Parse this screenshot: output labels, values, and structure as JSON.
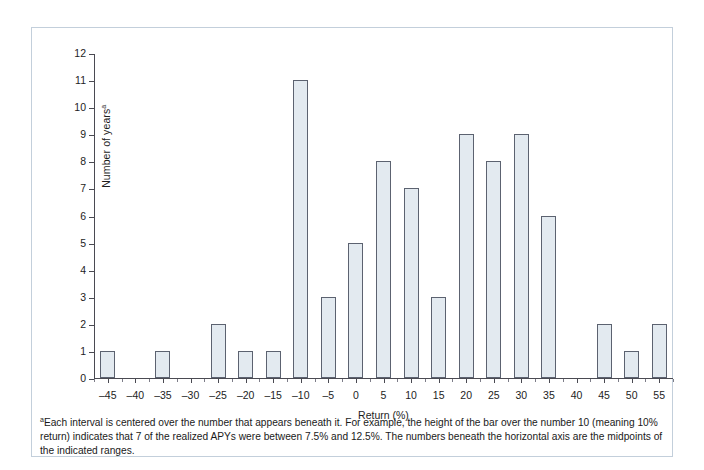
{
  "chart_data": {
    "type": "bar",
    "title": "",
    "xlabel": "Return (%)",
    "ylabel": "Number of years",
    "ylabel_superscript": "a",
    "categories": [
      -45,
      -40,
      -35,
      -30,
      -25,
      -20,
      -15,
      -10,
      -5,
      0,
      5,
      10,
      15,
      20,
      25,
      30,
      35,
      40,
      45,
      50,
      55
    ],
    "values": [
      1,
      0,
      1,
      0,
      2,
      1,
      1,
      11,
      3,
      5,
      8,
      7,
      3,
      9,
      8,
      9,
      6,
      0,
      2,
      1,
      2
    ],
    "x_tick_labels": [
      "–45",
      "–40",
      "–35",
      "–30",
      "–25",
      "–20",
      "–15",
      "–10",
      "–5",
      "0",
      "5",
      "10",
      "15",
      "20",
      "25",
      "30",
      "35",
      "40",
      "45",
      "50",
      "55"
    ],
    "y_tick_labels": [
      "0",
      "1",
      "2",
      "3",
      "4",
      "5",
      "6",
      "7",
      "8",
      "9",
      "10",
      "11",
      "12"
    ],
    "ylim": [
      0,
      12
    ],
    "xlim": [
      -47.5,
      57.5
    ],
    "grid": false,
    "legend": false,
    "bar_fill_color": "#e3eaf0",
    "bar_border_color": "#5c6270",
    "axis_color": "#4a4a52",
    "frame_color": "#c3cfdb"
  },
  "footnote": {
    "marker": "a",
    "text": "Each interval is centered over the number that appears beneath it. For example, the height of the bar over the number 10 (meaning 10% return) indicates that 7 of the realized APYs were between 7.5% and 12.5%. The numbers beneath the horizontal axis are the midpoints of the indicated ranges."
  }
}
